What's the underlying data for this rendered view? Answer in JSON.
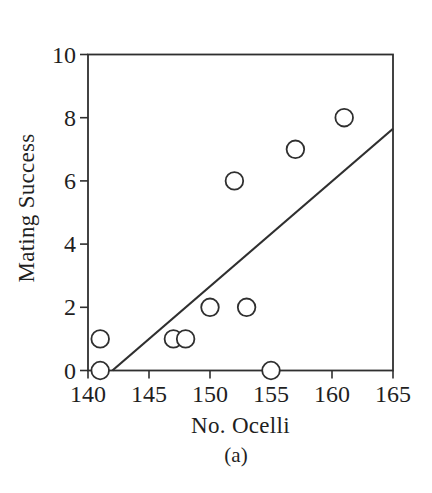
{
  "chart_data": {
    "type": "scatter",
    "title": "",
    "xlabel": "No. Ocelli",
    "ylabel": "Mating Success",
    "caption": "(a)",
    "xlim": [
      140,
      165
    ],
    "ylim": [
      0,
      10
    ],
    "xticks": [
      140,
      145,
      150,
      155,
      160,
      165
    ],
    "yticks": [
      0,
      2,
      4,
      6,
      8,
      10
    ],
    "grid": false,
    "legend": null,
    "points": [
      {
        "x": 141,
        "y": 0
      },
      {
        "x": 141,
        "y": 1
      },
      {
        "x": 147,
        "y": 1
      },
      {
        "x": 148,
        "y": 1
      },
      {
        "x": 150,
        "y": 2
      },
      {
        "x": 152,
        "y": 6
      },
      {
        "x": 153,
        "y": 2
      },
      {
        "x": 155,
        "y": 0
      },
      {
        "x": 157,
        "y": 7
      },
      {
        "x": 161,
        "y": 8
      }
    ],
    "trend_line": {
      "x1": 142,
      "y1": 0,
      "x2": 165,
      "y2": 7.65
    },
    "marker": {
      "shape": "open-circle",
      "radius_px": 8.8,
      "stroke_px": 1.8
    },
    "colors": {
      "stroke": "#2f2f2f",
      "text": "#1f1f1f",
      "background": "#ffffff"
    }
  }
}
